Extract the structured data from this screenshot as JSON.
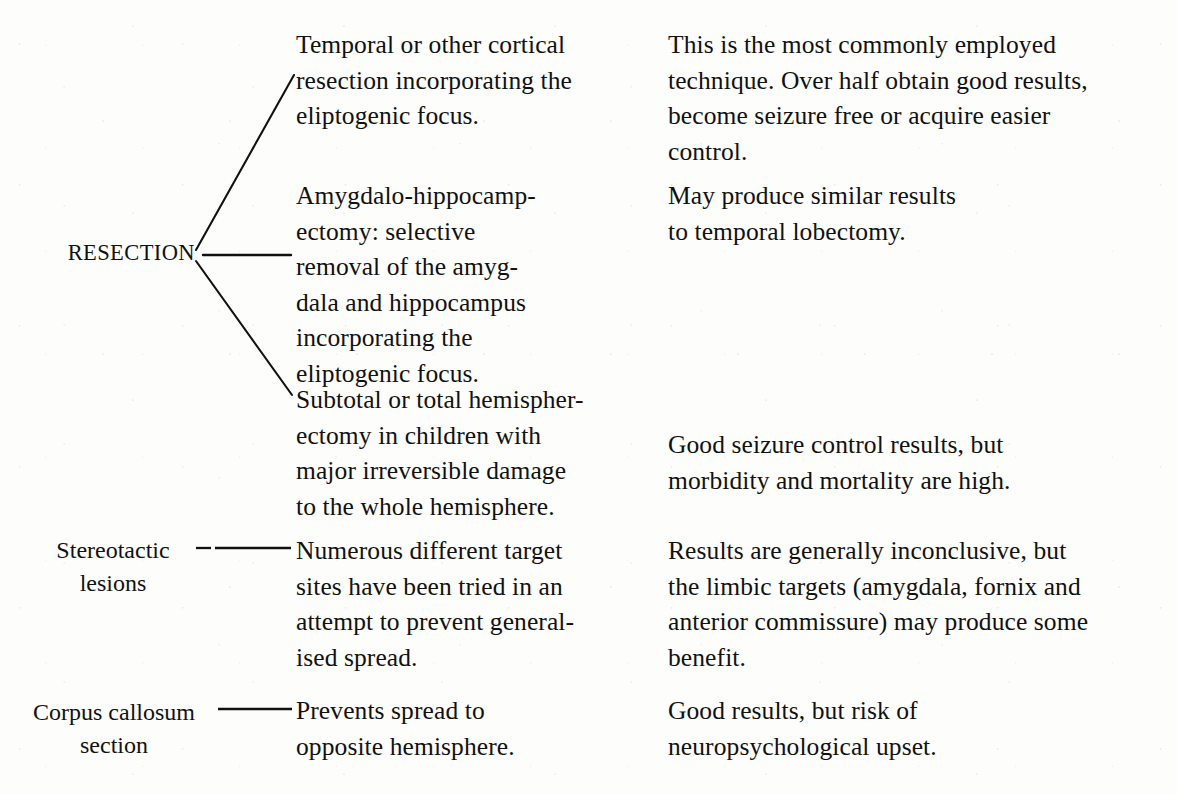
{
  "diagram": {
    "ink_color": "#111111",
    "paper_color": "#fdfdfc",
    "nodes": [
      {
        "id": "resection",
        "label": "RESECTION",
        "branches": [
          {
            "procedure": "Temporal or other cortical\nresection incorporating the\neliptogenic focus.",
            "outcome": "This is the most commonly employed\ntechnique. Over half obtain good results,\nbecome seizure free or acquire easier\ncontrol."
          },
          {
            "procedure": "Amygdalo-hippocamp-\nectomy: selective\nremoval of the amyg-\ndala and hippocampus\nincorporating the\neliptogenic focus.",
            "outcome": "May produce similar results\nto temporal lobectomy."
          },
          {
            "procedure": "Subtotal or total hemispher-\nectomy in children with\nmajor irreversible damage\nto the whole hemisphere.",
            "outcome": "Good seizure control results, but\nmorbidity and mortality are high."
          }
        ]
      },
      {
        "id": "stereotactic-lesions",
        "label": "Stereotactic\nlesions",
        "branches": [
          {
            "procedure": "Numerous different target\nsites have been tried in an\nattempt to prevent general-\nised spread.",
            "outcome": "Results are generally inconclusive, but\nthe limbic targets (amygdala, fornix and\nanterior commissure) may produce some\nbenefit."
          }
        ]
      },
      {
        "id": "corpus-callosum-section",
        "label": "Corpus callosum\nsection",
        "branches": [
          {
            "procedure": "Prevents spread to\nopposite hemisphere.",
            "outcome": "Good results, but risk of\nneuropsychological upset."
          }
        ]
      }
    ]
  }
}
